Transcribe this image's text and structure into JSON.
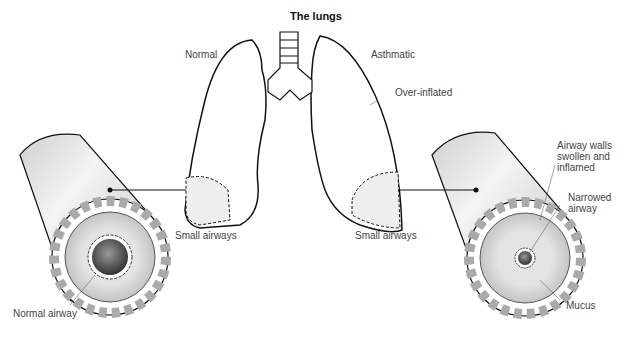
{
  "diagram": {
    "title": "The lungs",
    "labels": {
      "normal": "Normal",
      "asthmatic": "Asthmatic",
      "over_inflated": "Over-inflated",
      "small_airways_left": "Small airways",
      "small_airways_right": "Small airways",
      "normal_airway": "Normal airway",
      "airway_walls_1": "Airway walls",
      "airway_walls_2": "swollen and",
      "airway_walls_3": "inflamed",
      "narrowed_1": "Narrowed",
      "narrowed_2": "airway",
      "mucus": "Mucus"
    },
    "colors": {
      "outline": "#111111",
      "tube_light": "#f2f2f2",
      "tube_dark": "#bdbdbd",
      "label_text": "#444444"
    }
  }
}
